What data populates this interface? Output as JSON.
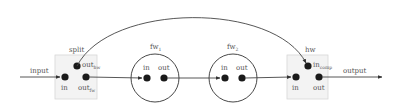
{
  "diagram": {
    "type": "dataflow",
    "external": {
      "input_label": "input",
      "output_label": "output"
    },
    "components": [
      {
        "id": "split",
        "title": "split",
        "shape": "box",
        "ports": [
          {
            "id": "in",
            "label": "in"
          },
          {
            "id": "out_hw",
            "label": "out",
            "subscript": "hw"
          },
          {
            "id": "out_fw",
            "label": "out",
            "subscript": "fw"
          }
        ]
      },
      {
        "id": "fw1",
        "title": "fw",
        "title_subscript": "1",
        "shape": "circle",
        "ports": [
          {
            "id": "in",
            "label": "in"
          },
          {
            "id": "out",
            "label": "out"
          }
        ]
      },
      {
        "id": "fw2",
        "title": "fw",
        "title_subscript": "2",
        "shape": "circle",
        "ports": [
          {
            "id": "in",
            "label": "in"
          },
          {
            "id": "out",
            "label": "out"
          }
        ]
      },
      {
        "id": "hw",
        "title": "hw",
        "shape": "box",
        "ports": [
          {
            "id": "in",
            "label": "in"
          },
          {
            "id": "in_comp",
            "label": "in",
            "subscript": "comp"
          },
          {
            "id": "out",
            "label": "out"
          }
        ]
      }
    ],
    "edges": [
      {
        "from": "input",
        "to": "split.in"
      },
      {
        "from": "split.out_fw",
        "to": "fw1.in"
      },
      {
        "from": "fw1.out",
        "to": "fw2.in"
      },
      {
        "from": "fw2.out",
        "to": "hw.in"
      },
      {
        "from": "split.out_hw",
        "to": "hw.in_comp",
        "style": "arc"
      },
      {
        "from": "hw.out",
        "to": "output"
      }
    ],
    "colors": {
      "box_fill": "#f3f3f3",
      "box_stroke": "#d6d6d6",
      "node": "#1a1a1a",
      "edge": "#444444",
      "label": "#555555"
    }
  }
}
